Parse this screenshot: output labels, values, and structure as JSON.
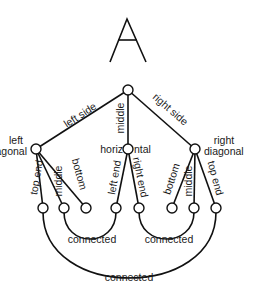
{
  "diagram": {
    "title_glyph": "A",
    "root": {
      "name": "root"
    },
    "edges": {
      "left_side": "left side",
      "middle": "middle",
      "right_side": "right side",
      "ld_top_end": "top end",
      "ld_middle": "middle",
      "ld_bottom": "bottom",
      "h_left_end": "left end",
      "h_right_end": "right end",
      "rd_bottom": "bottom",
      "rd_middle": "middle",
      "rd_top_end": "top end"
    },
    "nodes": {
      "left_diagonal_line1": "left",
      "left_diagonal_line2": "diagonal",
      "horizontal_a": "horiz",
      "horizontal_b": "ntal",
      "right_diagonal_line1": "right",
      "right_diagonal_line2": "diagonal"
    },
    "relations": {
      "connected_left": "connected",
      "connected_right": "connected",
      "connected_outer": "connected"
    }
  }
}
